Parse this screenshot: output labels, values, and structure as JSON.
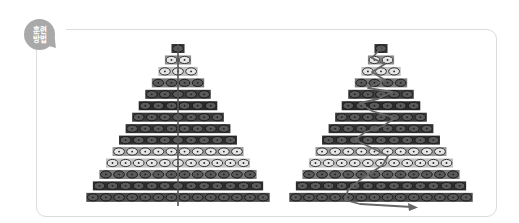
{
  "badge": {
    "line1": "훈련",
    "line2": "방법",
    "color": "#a9a9a9"
  },
  "diagram": {
    "rows": 14,
    "row_shades": [
      "#3a3a3a",
      "#8a8a8a",
      "#bdbdbd",
      "#777777",
      "#3c3c3c",
      "#2a2a2a",
      "#3a3a3a",
      "#333333",
      "#2e2e2e",
      "#9a9a9a",
      "#c0c0c0",
      "#7a7a7a",
      "#2e2e2e",
      "#4a4a4a"
    ],
    "left_pyramid": {
      "path": "vertical-line"
    },
    "right_pyramid": {
      "path": "zigzag-arrow"
    }
  }
}
